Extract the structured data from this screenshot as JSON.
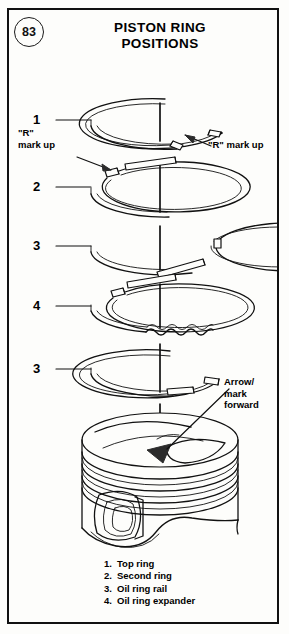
{
  "page": {
    "number": "83",
    "background": "#fdfdfb",
    "ink": "#000000",
    "border_color": "#111111"
  },
  "title": {
    "line1": "PISTON RING",
    "line2": "POSITIONS"
  },
  "callouts": [
    {
      "id": "callout-1",
      "number": "1",
      "y": 112,
      "target": "Top ring"
    },
    {
      "id": "callout-2",
      "number": "2",
      "y": 179,
      "target": "Second ring"
    },
    {
      "id": "callout-3-top",
      "number": "3",
      "y": 238,
      "target": "Oil ring rail"
    },
    {
      "id": "callout-4",
      "number": "4",
      "y": 298,
      "target": "Oil ring expander"
    },
    {
      "id": "callout-3-bot",
      "number": "3",
      "y": 361,
      "target": "Oil ring rail"
    }
  ],
  "annotations": {
    "r_mark_left": "\"R\"\nmark up",
    "r_mark_right": "\"R\" mark up",
    "arrow_mark": "Arrow/\nmark\nforward"
  },
  "legend": {
    "items": [
      {
        "number": "1.",
        "label": "Top ring"
      },
      {
        "number": "2.",
        "label": "Second ring"
      },
      {
        "number": "3.",
        "label": "Oil ring rail"
      },
      {
        "number": "4.",
        "label": "Oil ring expander"
      }
    ]
  },
  "diagram": {
    "type": "exploded-assembly",
    "center_axis_x": 160,
    "rings": [
      {
        "name": "top-ring",
        "callout": "1",
        "cy": 118,
        "rx": 74,
        "ry": 26,
        "gap_position": "bottom-right",
        "gap_angle_deg": 18,
        "profile": "rectangular"
      },
      {
        "name": "second-ring",
        "callout": "2",
        "cy": 186,
        "rx": 74,
        "ry": 26,
        "gap_position": "left",
        "gap_angle_deg": 170,
        "profile": "tapered"
      },
      {
        "name": "oil-ring-rail-top",
        "callout": "3",
        "cy": 244,
        "rx": 74,
        "ry": 25,
        "gap_position": "right",
        "gap_angle_deg": 5,
        "profile": "thin-rail"
      },
      {
        "name": "oil-ring-expander",
        "callout": "4",
        "cy": 303,
        "rx": 74,
        "ry": 25,
        "gap_position": "upper-left",
        "gap_angle_deg": 150,
        "profile": "corrugated"
      },
      {
        "name": "oil-ring-rail-bot",
        "callout": "3",
        "cy": 366,
        "rx": 74,
        "ry": 25,
        "gap_position": "bottom-right",
        "gap_angle_deg": 12,
        "profile": "thin-rail"
      }
    ],
    "piston": {
      "name": "piston",
      "crown_cy": 432,
      "rx": 78,
      "ry": 28,
      "ring_groove_count": 4,
      "features": [
        "domed-crown",
        "valve-relief-pockets",
        "ring-grooves",
        "piston-pin-bore",
        "scalloped-skirt"
      ],
      "forward_arrow": "solid-triangle-on-crown"
    }
  }
}
